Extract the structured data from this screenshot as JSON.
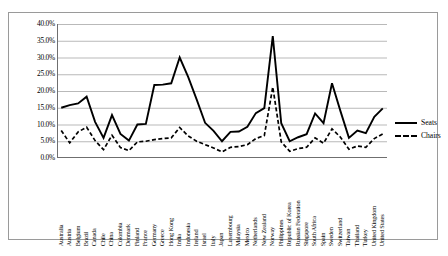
{
  "chart_data": {
    "type": "line",
    "title": "",
    "xlabel": "",
    "ylabel": "",
    "ylim": [
      0,
      0.4
    ],
    "ytick_labels": [
      "40.0%",
      "35.0%",
      "30.0%",
      "25.0%",
      "20.0%",
      "15.0%",
      "10.0%",
      "5.0%",
      "0.0%"
    ],
    "ytick_values": [
      0.4,
      0.35,
      0.3,
      0.25,
      0.2,
      0.15,
      0.1,
      0.05,
      0.0
    ],
    "grid": "horizontal",
    "legend_position": "right",
    "categories": [
      "Australia",
      "Austria",
      "Belgium",
      "Brazil",
      "Canada",
      "Chile",
      "China",
      "Colombia",
      "Denmark",
      "Finland",
      "France",
      "Germany",
      "Greece",
      "Hong Kong",
      "India",
      "Indonesia",
      "Ireland",
      "Israel",
      "Italy",
      "Japan",
      "Luxembourg",
      "Malaysia",
      "Mexico",
      "Netherlands",
      "New Zealand",
      "Norway",
      "Philippines",
      "Republic of Korea",
      "Russian Federation",
      "Singapore",
      "South Africa",
      "Spain",
      "Sweden",
      "Switzerland",
      "Taiwan",
      "Thailand",
      "Turkey",
      "United Kingdom",
      "United States"
    ],
    "series": [
      {
        "name": "Seats",
        "style": "solid",
        "color": "#000000",
        "values": [
          0.15,
          0.158,
          0.163,
          0.183,
          0.108,
          0.06,
          0.128,
          0.072,
          0.052,
          0.1,
          0.102,
          0.218,
          0.219,
          0.223,
          0.3,
          0.242,
          0.175,
          0.105,
          0.081,
          0.05,
          0.078,
          0.079,
          0.093,
          0.134,
          0.149,
          0.364,
          0.104,
          0.05,
          0.062,
          0.071,
          0.133,
          0.104,
          0.223,
          0.14,
          0.06,
          0.082,
          0.074,
          0.123,
          0.148
        ]
      },
      {
        "name": "Chairs",
        "style": "dashed",
        "color": "#000000",
        "values": [
          0.082,
          0.045,
          0.078,
          0.092,
          0.052,
          0.025,
          0.068,
          0.031,
          0.022,
          0.048,
          0.05,
          0.055,
          0.058,
          0.06,
          0.091,
          0.066,
          0.05,
          0.04,
          0.03,
          0.018,
          0.032,
          0.034,
          0.04,
          0.058,
          0.067,
          0.212,
          0.048,
          0.02,
          0.028,
          0.032,
          0.06,
          0.044,
          0.087,
          0.062,
          0.026,
          0.036,
          0.032,
          0.058,
          0.072
        ]
      }
    ]
  },
  "legend": {
    "items": [
      {
        "label": "Seats",
        "style": "solid"
      },
      {
        "label": "Chairs",
        "style": "dashed"
      }
    ]
  }
}
